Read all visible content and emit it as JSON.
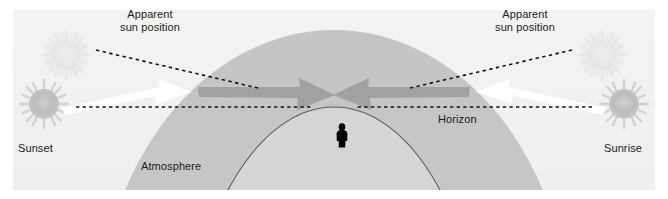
{
  "diagram": {
    "labels": {
      "apparent_sun_left": "Apparent\nsun position",
      "apparent_sun_right": "Apparent\nsun position",
      "sunset": "Sunset",
      "sunrise": "Sunrise",
      "atmosphere": "Atmosphere",
      "horizon": "Horizon"
    },
    "colors": {
      "background": "#f4f4f4",
      "sky": "#f2f2f2",
      "atmosphere": "#c9c9c9",
      "earth": "#d4d4d4",
      "horizon_curve": "#5a5a5a",
      "earth_curve": "#5a5a5a",
      "dashed_line": "#1a1a1a",
      "arrow_outer": "#ffffff",
      "arrow_inner": "#9a9a9a",
      "sun_actual": "#b9b9b9",
      "sun_apparent": "#e2e2e2",
      "observer": "#000000",
      "text": "#1b1b1b"
    },
    "elements": {
      "sun_actual_left": {
        "cx": 44,
        "cy": 104,
        "r": 15
      },
      "sun_apparent_left": {
        "cx": 66,
        "cy": 55,
        "r": 15
      },
      "sun_actual_right": {
        "cx": 624,
        "cy": 104,
        "r": 15
      },
      "sun_apparent_right": {
        "cx": 602,
        "cy": 55,
        "r": 15
      },
      "observer": {
        "x": 338,
        "y": 124,
        "w": 9,
        "h": 22
      },
      "horizon_line_y": 107,
      "atmosphere_dome": {
        "cx": 334,
        "cy": 330,
        "rx": 235,
        "ry": 300
      },
      "earth_dome": {
        "cx": 334,
        "cy": 400,
        "rx": 152,
        "ry": 285
      }
    },
    "annotations": [
      {
        "name": "leader-line-left",
        "from": [
          86,
          62
        ],
        "to": [
          250,
          100
        ]
      },
      {
        "name": "leader-line-right",
        "from": [
          582,
          62
        ],
        "to": [
          418,
          100
        ]
      },
      {
        "name": "ray-incoming-left",
        "direction": "right",
        "style": "white-outline"
      },
      {
        "name": "ray-refracted-left",
        "direction": "right",
        "style": "gray-fill"
      },
      {
        "name": "ray-incoming-right",
        "direction": "left",
        "style": "white-outline"
      },
      {
        "name": "ray-refracted-right",
        "direction": "left",
        "style": "gray-fill"
      }
    ]
  }
}
